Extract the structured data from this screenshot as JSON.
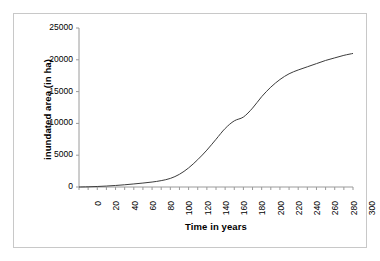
{
  "chart_data": {
    "type": "line",
    "title": "",
    "xlabel": "Time in years",
    "ylabel": "inundated area (in ha)",
    "xlim": [
      0,
      300
    ],
    "ylim": [
      0,
      25000
    ],
    "grid": false,
    "legend": null,
    "x_tick_labels": [
      "0",
      "20",
      "40",
      "60",
      "80",
      "100",
      "120",
      "140",
      "160",
      "180",
      "200",
      "220",
      "240",
      "260",
      "280",
      "300"
    ],
    "x_tick_step": 20,
    "x_minor_tick_step": 10,
    "y_tick_labels": [
      "0",
      "5000",
      "10000",
      "15000",
      "20000",
      "25000"
    ],
    "y_tick_step": 5000,
    "series": [
      {
        "name": "inundated area",
        "color": "#3c3c3c",
        "x": [
          0,
          10,
          20,
          30,
          40,
          50,
          60,
          70,
          80,
          90,
          100,
          110,
          120,
          130,
          140,
          150,
          160,
          170,
          180,
          190,
          200,
          210,
          220,
          230,
          240,
          250,
          260,
          270,
          280,
          290,
          300
        ],
        "values": [
          0,
          30,
          80,
          150,
          240,
          350,
          480,
          620,
          780,
          1000,
          1350,
          2000,
          3000,
          4300,
          5800,
          7500,
          9200,
          10400,
          11000,
          12400,
          14200,
          15700,
          16900,
          17800,
          18400,
          18900,
          19400,
          19900,
          20300,
          20700,
          21000
        ]
      }
    ]
  },
  "axes": {
    "y_title": "inundated area (in ha)",
    "x_title": "Time in years"
  }
}
